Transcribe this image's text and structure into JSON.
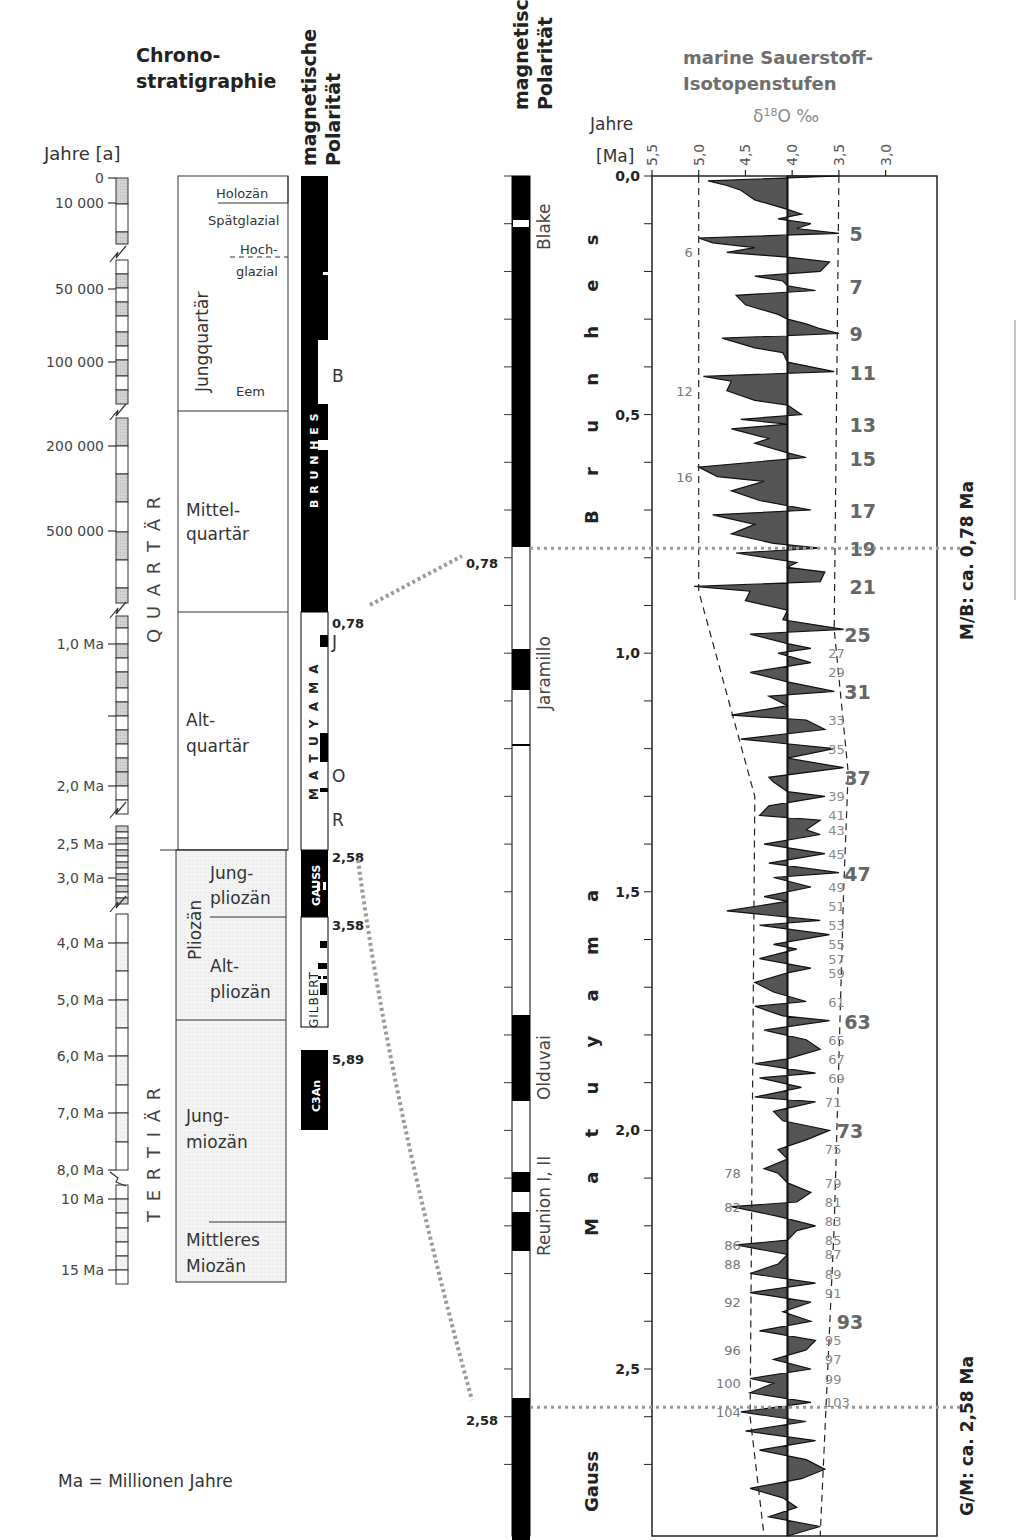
{
  "left": {
    "title_line1": "Chrono-",
    "title_line2": "stratigraphie",
    "polarity_title_line1": "magnetische",
    "polarity_title_line2": "Polarität",
    "axis_label": "Jahre [a]",
    "axis_ticks": [
      {
        "label": "0",
        "y": 178
      },
      {
        "label": "10 000",
        "y": 203
      },
      {
        "label": "50 000",
        "y": 289
      },
      {
        "label": "100 000",
        "y": 362
      },
      {
        "label": "200 000",
        "y": 446
      },
      {
        "label": "500 000",
        "y": 531
      },
      {
        "label": "1,0 Ma",
        "y": 644
      },
      {
        "label": "",
        "y": 716
      },
      {
        "label": "2,0 Ma",
        "y": 786
      },
      {
        "label": "2,5 Ma",
        "y": 844
      },
      {
        "label": "3,0 Ma",
        "y": 878
      },
      {
        "label": "4,0 Ma",
        "y": 943
      },
      {
        "label": "5,0 Ma",
        "y": 1000
      },
      {
        "label": "6,0 Ma",
        "y": 1056
      },
      {
        "label": "7,0 Ma",
        "y": 1113
      },
      {
        "label": "8,0 Ma",
        "y": 1170
      },
      {
        "label": "10 Ma",
        "y": 1199
      },
      {
        "label": "15 Ma",
        "y": 1270
      }
    ],
    "system_labels": {
      "quartaer": "Q U A R T Ä R",
      "tertiaer": "T E R T I Ä R"
    },
    "epochs": {
      "holozaen": "Holozän",
      "spaetglazial": "Spätglazial",
      "hochglazial_1": "Hoch-",
      "hochglazial_2": "glazial",
      "jungquartaer": "Jungquartär",
      "eem": "Eem",
      "mittelquartaer_1": "Mittel-",
      "mittelquartaer_2": "quartär",
      "altquartaer_1": "Alt-",
      "altquartaer_2": "quartär",
      "pliozaen": "Pliozän",
      "jungpliozaen_1": "Jung-",
      "jungpliozaen_2": "pliozän",
      "altpliozaen_1": "Alt-",
      "altpliozaen_2": "pliozän",
      "jungmiozaen_1": "Jung-",
      "jungmiozaen_2": "miozän",
      "mittleres_miozaen_1": "Mittleres",
      "mittleres_miozaen_2": "Miozän"
    },
    "chrons": {
      "brunhes": "B R U N H E S",
      "matuyama": "M A T U Y A M A",
      "gauss": "GAUSS",
      "gilbert": "GILBERT",
      "c3an": "C3An"
    },
    "events": {
      "b": "B",
      "j": "J",
      "o": "O",
      "r": "R"
    },
    "boundaries": {
      "b078": "0,78",
      "b258": "2,58",
      "b358": "3,58",
      "b589": "5,89"
    },
    "footnote": "Ma = Millionen Jahre"
  },
  "right": {
    "polarity_title_line1": "magnetische",
    "polarity_title_line2": "Polarität",
    "events": {
      "blake": "Blake",
      "jaramillo": "Jaramillo",
      "olduvai": "Olduvai",
      "reunion": "Reunion I, II"
    },
    "chrons": {
      "brunhes": "B r u n h e s",
      "matuyama": "M a t u y a m a",
      "gauss": "Gauss"
    },
    "boundary_078": "0,78",
    "boundary_258": "2,58",
    "mb_label": "M/B: ca. 0,78 Ma",
    "gm_label": "G/M: ca. 2,58 Ma"
  },
  "colors": {
    "grey_text": "#6e6e6e",
    "fill": "#555555",
    "dotted": "#9a9a9a",
    "stipple": "#cfcfcf",
    "plio": "#f2f2f2"
  },
  "chart_data": {
    "type": "area",
    "subtitle": "δ18O ‰",
    "xlabel": "δ18O ‰",
    "ylabel": "Jahre [Ma]",
    "x_ticks": [
      "5,5",
      "5,0",
      "4,5",
      "4,0",
      "3,5",
      "3,0"
    ],
    "x_tick_values": [
      5.5,
      5.0,
      4.5,
      4.0,
      3.5,
      3.0
    ],
    "xlim": [
      5.5,
      2.3
    ],
    "y_ticks": [
      "0,0",
      "0,5",
      "1,0",
      "1,5",
      "2,0",
      "2,5"
    ],
    "y_tick_values": [
      0.0,
      0.5,
      1.0,
      1.5,
      2.0,
      2.5
    ],
    "ylim": [
      0.0,
      2.85
    ],
    "grid": false,
    "baseline": 4.05,
    "stage_labels": [
      {
        "stage": "5",
        "age": 0.12,
        "bold": true
      },
      {
        "stage": "6",
        "age": 0.16,
        "bold": false,
        "side": "left"
      },
      {
        "stage": "7",
        "age": 0.23,
        "bold": true
      },
      {
        "stage": "9",
        "age": 0.33,
        "bold": true
      },
      {
        "stage": "11",
        "age": 0.41,
        "bold": true
      },
      {
        "stage": "12",
        "age": 0.45,
        "bold": false,
        "side": "left"
      },
      {
        "stage": "13",
        "age": 0.52,
        "bold": true
      },
      {
        "stage": "15",
        "age": 0.59,
        "bold": true
      },
      {
        "stage": "16",
        "age": 0.63,
        "bold": false,
        "side": "left"
      },
      {
        "stage": "17",
        "age": 0.7,
        "bold": true
      },
      {
        "stage": "19",
        "age": 0.78,
        "bold": true
      },
      {
        "stage": "21",
        "age": 0.86,
        "bold": true
      },
      {
        "stage": "25",
        "age": 0.96,
        "bold": true
      },
      {
        "stage": "27",
        "age": 1.0,
        "bold": false
      },
      {
        "stage": "29",
        "age": 1.04,
        "bold": false
      },
      {
        "stage": "31",
        "age": 1.08,
        "bold": true
      },
      {
        "stage": "33",
        "age": 1.14,
        "bold": false
      },
      {
        "stage": "35",
        "age": 1.2,
        "bold": false
      },
      {
        "stage": "37",
        "age": 1.26,
        "bold": true
      },
      {
        "stage": "39",
        "age": 1.3,
        "bold": false
      },
      {
        "stage": "41",
        "age": 1.34,
        "bold": false
      },
      {
        "stage": "43",
        "age": 1.37,
        "bold": false
      },
      {
        "stage": "45",
        "age": 1.42,
        "bold": false
      },
      {
        "stage": "47",
        "age": 1.46,
        "bold": true
      },
      {
        "stage": "49",
        "age": 1.49,
        "bold": false
      },
      {
        "stage": "51",
        "age": 1.53,
        "bold": false
      },
      {
        "stage": "53",
        "age": 1.57,
        "bold": false
      },
      {
        "stage": "55",
        "age": 1.61,
        "bold": false
      },
      {
        "stage": "57",
        "age": 1.64,
        "bold": false
      },
      {
        "stage": "59",
        "age": 1.67,
        "bold": false
      },
      {
        "stage": "61",
        "age": 1.73,
        "bold": false
      },
      {
        "stage": "63",
        "age": 1.77,
        "bold": true
      },
      {
        "stage": "65",
        "age": 1.81,
        "bold": false
      },
      {
        "stage": "67",
        "age": 1.85,
        "bold": false
      },
      {
        "stage": "69",
        "age": 1.89,
        "bold": false
      },
      {
        "stage": "71",
        "age": 1.94,
        "bold": false
      },
      {
        "stage": "73",
        "age": 2.0,
        "bold": true
      },
      {
        "stage": "75",
        "age": 2.04,
        "bold": false
      },
      {
        "stage": "78",
        "age": 2.09,
        "bold": false,
        "side": "left"
      },
      {
        "stage": "79",
        "age": 2.11,
        "bold": false
      },
      {
        "stage": "81",
        "age": 2.15,
        "bold": false
      },
      {
        "stage": "82",
        "age": 2.16,
        "bold": false,
        "side": "left"
      },
      {
        "stage": "83",
        "age": 2.19,
        "bold": false
      },
      {
        "stage": "85",
        "age": 2.23,
        "bold": false
      },
      {
        "stage": "86",
        "age": 2.24,
        "bold": false,
        "side": "left"
      },
      {
        "stage": "87",
        "age": 2.26,
        "bold": false
      },
      {
        "stage": "88",
        "age": 2.28,
        "bold": false,
        "side": "left"
      },
      {
        "stage": "89",
        "age": 2.3,
        "bold": false
      },
      {
        "stage": "91",
        "age": 2.34,
        "bold": false
      },
      {
        "stage": "92",
        "age": 2.36,
        "bold": false,
        "side": "left"
      },
      {
        "stage": "93",
        "age": 2.4,
        "bold": true
      },
      {
        "stage": "95",
        "age": 2.44,
        "bold": false
      },
      {
        "stage": "96",
        "age": 2.46,
        "bold": false,
        "side": "left"
      },
      {
        "stage": "97",
        "age": 2.48,
        "bold": false
      },
      {
        "stage": "99",
        "age": 2.52,
        "bold": false
      },
      {
        "stage": "100",
        "age": 2.53,
        "bold": false,
        "side": "left"
      },
      {
        "stage": "103",
        "age": 2.57,
        "bold": false
      },
      {
        "stage": "104",
        "age": 2.59,
        "bold": false,
        "side": "left"
      }
    ],
    "series": [
      {
        "name": "δ18O",
        "ages": [
          0.0,
          0.01,
          0.02,
          0.03,
          0.05,
          0.07,
          0.08,
          0.09,
          0.1,
          0.11,
          0.12,
          0.13,
          0.14,
          0.15,
          0.16,
          0.17,
          0.18,
          0.2,
          0.21,
          0.22,
          0.23,
          0.24,
          0.25,
          0.27,
          0.29,
          0.3,
          0.31,
          0.32,
          0.33,
          0.34,
          0.36,
          0.37,
          0.39,
          0.41,
          0.42,
          0.43,
          0.45,
          0.47,
          0.48,
          0.5,
          0.51,
          0.52,
          0.53,
          0.55,
          0.56,
          0.58,
          0.59,
          0.61,
          0.63,
          0.64,
          0.66,
          0.68,
          0.7,
          0.71,
          0.73,
          0.75,
          0.77,
          0.78,
          0.79,
          0.81,
          0.82,
          0.83,
          0.85,
          0.86,
          0.87,
          0.89,
          0.91,
          0.93,
          0.95,
          0.96,
          0.98,
          0.99,
          1.0,
          1.02,
          1.04,
          1.06,
          1.08,
          1.09,
          1.11,
          1.13,
          1.14,
          1.16,
          1.18,
          1.2,
          1.22,
          1.24,
          1.26,
          1.27,
          1.29,
          1.3,
          1.32,
          1.34,
          1.35,
          1.37,
          1.38,
          1.4,
          1.42,
          1.44,
          1.46,
          1.47,
          1.49,
          1.51,
          1.52,
          1.54,
          1.56,
          1.57,
          1.59,
          1.61,
          1.62,
          1.64,
          1.66,
          1.67,
          1.69,
          1.71,
          1.73,
          1.74,
          1.76,
          1.77,
          1.79,
          1.81,
          1.83,
          1.85,
          1.86,
          1.88,
          1.89,
          1.91,
          1.93,
          1.94,
          1.96,
          1.98,
          2.0,
          2.02,
          2.04,
          2.06,
          2.08,
          2.09,
          2.11,
          2.13,
          2.15,
          2.16,
          2.18,
          2.2,
          2.21,
          2.23,
          2.24,
          2.26,
          2.28,
          2.3,
          2.32,
          2.34,
          2.36,
          2.38,
          2.4,
          2.42,
          2.44,
          2.46,
          2.48,
          2.5,
          2.52,
          2.53,
          2.55,
          2.57,
          2.59,
          2.61,
          2.63,
          2.65,
          2.67,
          2.69,
          2.71,
          2.73,
          2.75,
          2.77,
          2.79,
          2.81,
          2.83,
          2.85
        ],
        "values": [
          3.5,
          4.9,
          4.7,
          4.55,
          4.4,
          4.05,
          3.9,
          4.15,
          3.8,
          3.95,
          3.5,
          5.0,
          4.85,
          4.4,
          4.7,
          4.05,
          3.6,
          3.7,
          4.4,
          4.1,
          4.05,
          3.75,
          4.6,
          4.5,
          4.15,
          4.05,
          3.85,
          3.7,
          3.5,
          4.75,
          4.4,
          4.1,
          4.05,
          3.55,
          4.95,
          4.65,
          4.7,
          4.4,
          4.05,
          3.9,
          4.55,
          4.05,
          4.65,
          4.25,
          4.4,
          4.05,
          3.85,
          5.0,
          4.8,
          4.3,
          4.65,
          4.35,
          3.8,
          4.85,
          4.4,
          4.65,
          4.2,
          3.7,
          4.6,
          3.95,
          4.05,
          3.65,
          3.7,
          5.05,
          4.45,
          4.5,
          4.05,
          4.1,
          3.45,
          4.45,
          4.05,
          3.8,
          4.15,
          3.8,
          4.45,
          4.05,
          3.55,
          4.25,
          4.05,
          4.65,
          3.85,
          3.65,
          4.55,
          3.55,
          4.05,
          3.45,
          4.25,
          4.2,
          4.05,
          3.65,
          4.25,
          4.35,
          3.7,
          3.85,
          3.7,
          4.3,
          3.65,
          4.25,
          3.5,
          4.2,
          3.8,
          4.3,
          4.05,
          4.7,
          3.7,
          4.35,
          3.6,
          4.2,
          3.95,
          4.35,
          3.8,
          4.05,
          4.4,
          4.2,
          3.85,
          4.4,
          4.1,
          3.6,
          4.3,
          3.85,
          3.7,
          4.05,
          4.4,
          3.75,
          4.35,
          3.9,
          4.4,
          3.75,
          4.2,
          4.1,
          3.6,
          3.85,
          4.15,
          4.05,
          4.3,
          4.15,
          4.05,
          3.8,
          3.95,
          4.65,
          4.15,
          3.75,
          3.95,
          4.05,
          4.6,
          4.05,
          4.15,
          4.45,
          3.75,
          4.45,
          3.8,
          4.1,
          3.8,
          4.35,
          3.75,
          3.85,
          4.2,
          3.8,
          4.45,
          4.2,
          4.45,
          3.8,
          4.55,
          3.85,
          4.5,
          3.75,
          4.35,
          3.85,
          3.65,
          3.9,
          4.45,
          4.1,
          3.95,
          4.25,
          3.7,
          4.05,
          4.15,
          3.55,
          3.8,
          3.7
        ]
      }
    ],
    "envelope_left": [
      {
        "age": 0.0,
        "value": 5.0
      },
      {
        "age": 0.87,
        "value": 5.0
      },
      {
        "age": 1.3,
        "value": 4.4
      },
      {
        "age": 2.6,
        "value": 4.45
      },
      {
        "age": 2.85,
        "value": 4.3
      }
    ],
    "envelope_right": [
      {
        "age": 0.0,
        "value": 3.5
      },
      {
        "age": 0.95,
        "value": 3.55
      },
      {
        "age": 1.25,
        "value": 3.4
      },
      {
        "age": 1.5,
        "value": 3.45
      },
      {
        "age": 2.2,
        "value": 3.55
      },
      {
        "age": 2.85,
        "value": 3.7
      }
    ]
  }
}
